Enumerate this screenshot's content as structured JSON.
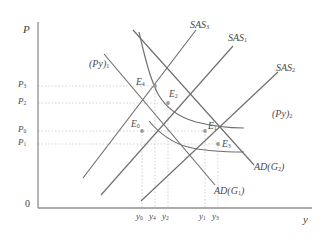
{
  "figure": {
    "kind": "economics-as-ad-diagram",
    "axes": {
      "y_axis_label": "P",
      "x_axis_label": "y",
      "origin_label": "0"
    },
    "price_ticks": [
      {
        "id": "P3",
        "base": "P",
        "sub": "3",
        "y_px": 86
      },
      {
        "id": "P2",
        "base": "P",
        "sub": "2",
        "y_px": 103
      },
      {
        "id": "P0",
        "base": "P",
        "sub": "0",
        "y_px": 131
      },
      {
        "id": "P1",
        "base": "P",
        "sub": "1",
        "y_px": 144
      }
    ],
    "output_ticks": [
      {
        "id": "y0",
        "base": "y",
        "sub": "0",
        "x_px": 142
      },
      {
        "id": "y4",
        "base": "y",
        "sub": "4",
        "x_px": 155
      },
      {
        "id": "y2",
        "base": "y",
        "sub": "2",
        "x_px": 168
      },
      {
        "id": "y1",
        "base": "y",
        "sub": "1",
        "x_px": 205
      },
      {
        "id": "y3",
        "base": "y",
        "sub": "3",
        "x_px": 218
      }
    ],
    "curves": [
      {
        "id": "SAS3",
        "base": "SAS",
        "sub": "3",
        "type": "short-run-aggregate-supply"
      },
      {
        "id": "SAS1",
        "base": "SAS",
        "sub": "1",
        "type": "short-run-aggregate-supply"
      },
      {
        "id": "SAS2",
        "base": "SAS",
        "sub": "2",
        "type": "short-run-aggregate-supply"
      },
      {
        "id": "Py1",
        "base": "(Py)",
        "sub": "1",
        "type": "nominal-income-hyperbola"
      },
      {
        "id": "Py2",
        "base": "(Py)",
        "sub": "2",
        "type": "nominal-income-hyperbola"
      },
      {
        "id": "ADG1",
        "base": "AD(G",
        "sub": "1",
        "tail": ")",
        "type": "aggregate-demand"
      },
      {
        "id": "ADG2",
        "base": "AD(G",
        "sub": "2",
        "tail": ")",
        "type": "aggregate-demand"
      }
    ],
    "equilibria": [
      {
        "id": "E0",
        "base": "E",
        "sub": "0",
        "x_px": 142,
        "y_px": 131,
        "price": "P0",
        "output": "y0"
      },
      {
        "id": "E4",
        "base": "E",
        "sub": "4",
        "x_px": 155,
        "y_px": 86,
        "price": "P3",
        "output": "y4"
      },
      {
        "id": "E2",
        "base": "E",
        "sub": "2",
        "x_px": 168,
        "y_px": 103,
        "price": "P2",
        "output": "y2"
      },
      {
        "id": "E1",
        "base": "E",
        "sub": "1",
        "x_px": 205,
        "y_px": 131,
        "price": "P0",
        "output": "y1"
      },
      {
        "id": "E3",
        "base": "E",
        "sub": "3",
        "x_px": 218,
        "y_px": 144,
        "price": "P1",
        "output": "y3"
      }
    ],
    "colors": {
      "curve": "#6e6e6e",
      "axis": "#8a8a8a",
      "guide": "#bdbdbd",
      "text": "#4a4a4a",
      "point": "#9a9a9a",
      "background": "#ffffff"
    }
  }
}
